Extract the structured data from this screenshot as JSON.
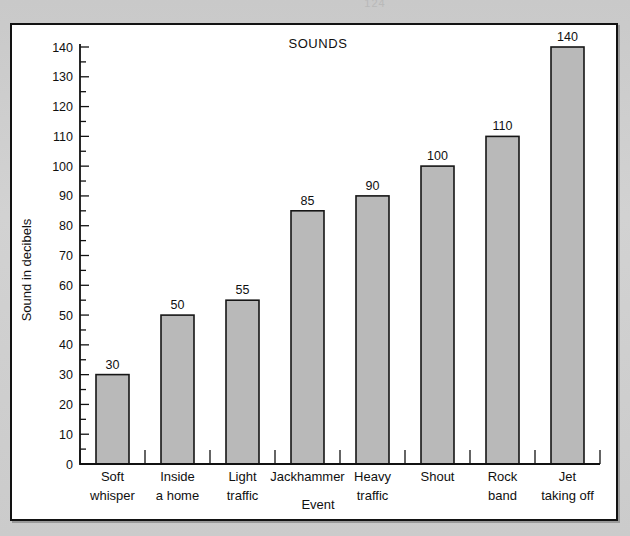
{
  "page": {
    "top_artifact_text": "124",
    "background_color": "#cfcfcf",
    "panel_background": "#ffffff",
    "panel_border_color": "#121212"
  },
  "chart_data": {
    "type": "bar",
    "title": "SOUNDS",
    "xlabel": "Event",
    "ylabel": "Sound in decibels",
    "categories": [
      "Soft whisper",
      "Inside a home",
      "Light traffic",
      "Jackhammer",
      "Heavy traffic",
      "Shout",
      "Rock band",
      "Jet taking off"
    ],
    "category_lines": [
      [
        "Soft",
        "whisper"
      ],
      [
        "Inside",
        "a home"
      ],
      [
        "Light",
        "traffic"
      ],
      [
        "Jackhammer",
        ""
      ],
      [
        "Heavy",
        "traffic"
      ],
      [
        "Shout",
        ""
      ],
      [
        "Rock",
        "band"
      ],
      [
        "Jet",
        "taking off"
      ]
    ],
    "values": [
      30,
      50,
      55,
      85,
      90,
      100,
      110,
      140
    ],
    "value_labels": [
      "30",
      "50",
      "55",
      "85",
      "90",
      "100",
      "110",
      "140"
    ],
    "ylim": [
      0,
      140
    ],
    "ytick_labels": [
      "0",
      "10",
      "20",
      "30",
      "40",
      "50",
      "60",
      "70",
      "80",
      "90",
      "100",
      "110",
      "120",
      "130",
      "140"
    ],
    "ytick_values": [
      0,
      10,
      20,
      30,
      40,
      50,
      60,
      70,
      80,
      90,
      100,
      110,
      120,
      130,
      140
    ],
    "yminor_values": [
      5,
      15,
      25,
      35,
      45,
      55,
      65,
      75,
      85,
      95,
      105,
      115,
      125,
      135
    ],
    "grid": false,
    "legend": null,
    "bar_fill_color": "#b9b9b9",
    "bar_border_color": "#161616",
    "axis_color": "#111111"
  }
}
